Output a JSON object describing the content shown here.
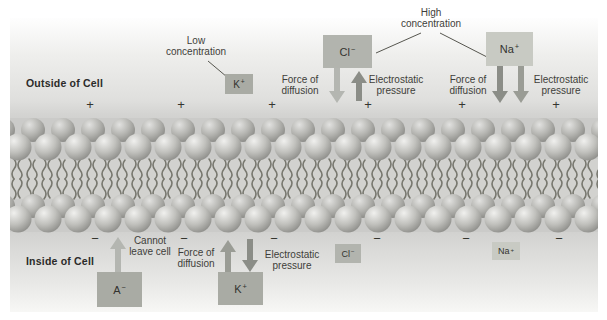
{
  "figure": {
    "outside_label": "Outside of Cell",
    "inside_label": "Inside of Cell",
    "outside_charge_sign": "+",
    "inside_charge_sign": "−"
  },
  "annotations": {
    "low_concentration": "Low concentration",
    "high_concentration": "High concentration",
    "force_of_diffusion": "Force of diffusion",
    "electrostatic_pressure": "Electrostatic pressure",
    "cannot_leave_cell": "Cannot leave cell"
  },
  "ions": {
    "outside_k": {
      "base": "K",
      "sign": "+"
    },
    "outside_cl": {
      "base": "Cl",
      "sign": "−"
    },
    "outside_na": {
      "base": "Na",
      "sign": "+"
    },
    "inside_a": {
      "base": "A",
      "sign": "−"
    },
    "inside_k": {
      "base": "K",
      "sign": "+"
    },
    "inside_cl": {
      "base": "Cl",
      "sign": "−"
    },
    "inside_na": {
      "base": "Na",
      "sign": "+"
    }
  },
  "colors": {
    "box_gray": "#a9aba4",
    "box_medium": "#b2b4ae",
    "box_light": "#c8cac3",
    "arrow_light": "#b4b6b1",
    "arrow_medium": "#9a9c95",
    "arrow_dark": "#8b8d87",
    "leader_line": "#56564f"
  }
}
